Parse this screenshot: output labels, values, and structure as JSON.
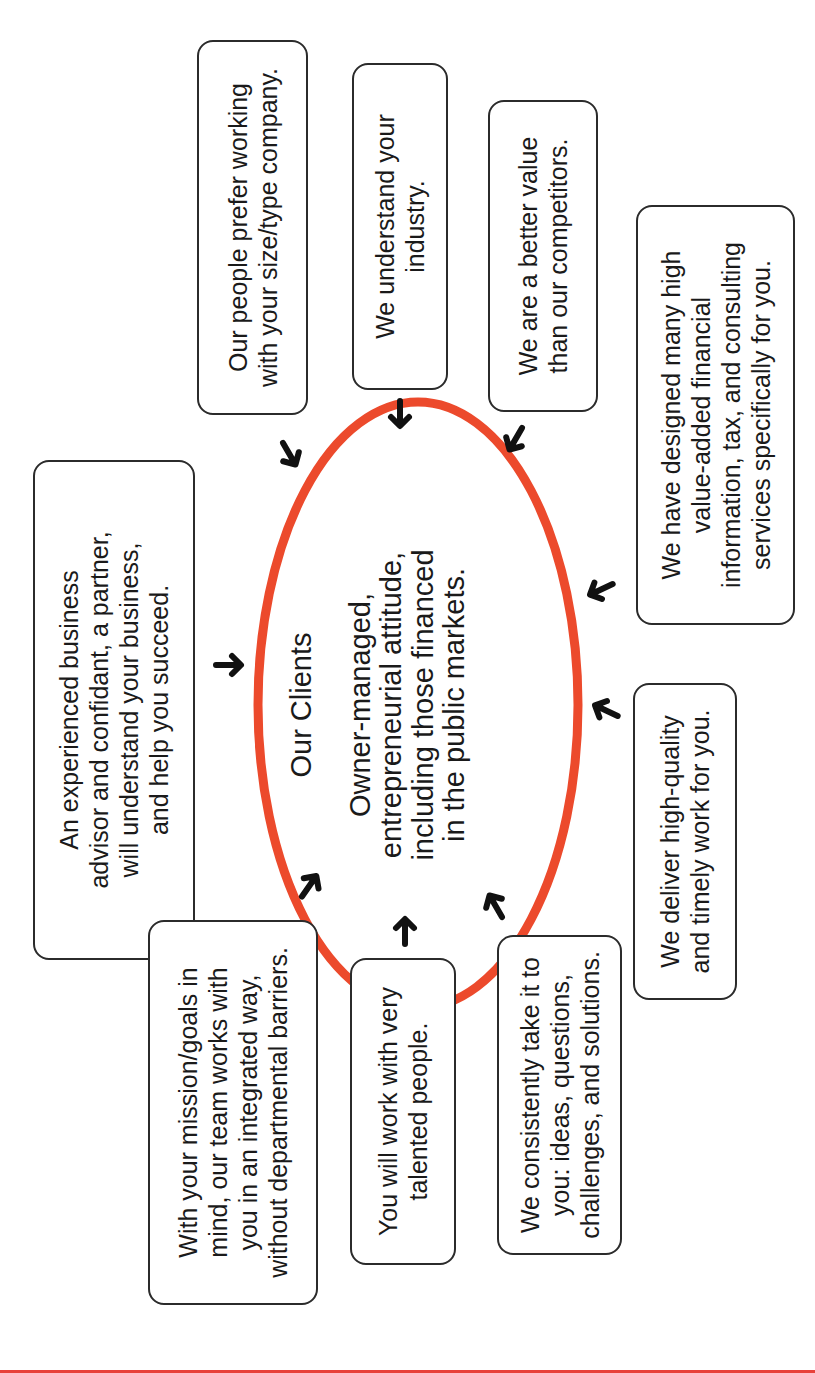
{
  "diagram": {
    "center": {
      "title": "Our Clients",
      "description": "Owner-managed,\nentrepreneurial attitude,\nincluding those financed\nin the public markets."
    },
    "boxes": [
      {
        "id": "size-type",
        "text": "Our people prefer working\nwith your size/type company."
      },
      {
        "id": "industry",
        "text": "We understand your\nindustry."
      },
      {
        "id": "better-value",
        "text": "We are a better value\nthan our competitors."
      },
      {
        "id": "designed-services",
        "text": "We have designed many high\nvalue-added financial\ninformation, tax, and consulting\nservices specifically for you."
      },
      {
        "id": "experienced-advisor",
        "text": "An experienced business\nadvisor and confidant, a partner,\nwill understand your business,\nand help you succeed."
      },
      {
        "id": "high-quality",
        "text": "We deliver high-quality\nand timely work for you."
      },
      {
        "id": "take-it-to-you",
        "text": "We consistently take it to\nyou: ideas, questions,\nchallenges, and solutions."
      },
      {
        "id": "talented-people",
        "text": "You will work with very\ntalented people."
      },
      {
        "id": "integrated-team",
        "text": "With your mission/goals in\nmind, our team works with\nyou in an integrated way,\nwithout departmental barriers."
      }
    ],
    "icons": {
      "arrow": "arrow-icon"
    },
    "colors": {
      "ellipse_stroke": "#ec4a2c",
      "box_border": "#2b2b2b",
      "rule_red": "#e8413a",
      "rule_yellow": "#f4b64a",
      "arrow": "#111111"
    }
  }
}
